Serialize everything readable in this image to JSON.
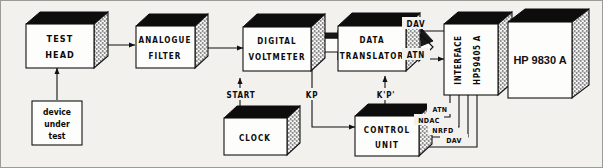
{
  "diagram": {
    "background_color": "#f2f1ee",
    "ink_color": "#111111",
    "blocks": [
      {
        "id": "test-head",
        "lines": [
          "TEST",
          "HEAD"
        ],
        "style": "box3d"
      },
      {
        "id": "device-under-test",
        "lines": [
          "device",
          "under",
          "test"
        ],
        "style": "flat"
      },
      {
        "id": "analogue-filter",
        "lines": [
          "ANALOGUE",
          "FILTER"
        ],
        "style": "box3d"
      },
      {
        "id": "digital-voltmeter",
        "lines": [
          "DIGITAL",
          "VOLTMETER"
        ],
        "style": "box3d"
      },
      {
        "id": "clock",
        "lines": [
          "CLOCK"
        ],
        "style": "box3d"
      },
      {
        "id": "data-translator",
        "lines": [
          "DATA",
          "TRANSLATOR"
        ],
        "style": "box3d"
      },
      {
        "id": "control-unit",
        "lines": [
          "CONTROL",
          "UNIT"
        ],
        "style": "box3d"
      },
      {
        "id": "interface",
        "lines": [
          "INTERFACE",
          "HP59405 A"
        ],
        "style": "box3d-vertical-text"
      },
      {
        "id": "hp9830a",
        "lines": [
          "HP 9830 A"
        ],
        "style": "box3d-large"
      }
    ],
    "signals": [
      {
        "id": "start",
        "label": "START",
        "from": "clock",
        "to": "digital-voltmeter"
      },
      {
        "id": "kp",
        "label": "KP",
        "from": "digital-voltmeter",
        "to": "control-unit"
      },
      {
        "id": "kpp",
        "label": "K'P'",
        "from": "control-unit",
        "to": "data-translator"
      },
      {
        "id": "dav-top",
        "label": "DAV",
        "from": "interface",
        "to": "data-translator"
      },
      {
        "id": "atn-top",
        "label": "ATN",
        "from": "data-translator",
        "to": "interface"
      },
      {
        "id": "atn-bus",
        "label": "ATN",
        "from": "interface",
        "to": "control-unit"
      },
      {
        "id": "ndac-bus",
        "label": "NDAC",
        "from": "interface",
        "to": "control-unit"
      },
      {
        "id": "nrfd-bus",
        "label": "NRFD",
        "from": "interface",
        "to": "control-unit"
      },
      {
        "id": "dav-bus",
        "label": "DAV",
        "from": "interface",
        "to": "control-unit"
      }
    ],
    "labels": {
      "test_head": "TEST",
      "test_head2": "HEAD",
      "dut1": "device",
      "dut2": "under",
      "dut3": "test",
      "analogue": "ANALOGUE",
      "filter": "FILTER",
      "digital": "DIGITAL",
      "voltmeter": "VOLTMETER",
      "clock": "CLOCK",
      "data": "DATA",
      "translator": "TRANSLATOR",
      "control": "CONTROL",
      "unit": "UNIT",
      "interface": "INTERFACE",
      "interface_model": "HP59405 A",
      "hp9830a": "HP 9830 A",
      "start": "START",
      "kp": "KP",
      "kpp": "K'P'",
      "dav_top": "DAV",
      "atn_top": "ATN",
      "atn_bus": "ATN",
      "ndac_bus": "NDAC",
      "nrfd_bus": "NRFD",
      "dav_bus": "DAV"
    }
  }
}
